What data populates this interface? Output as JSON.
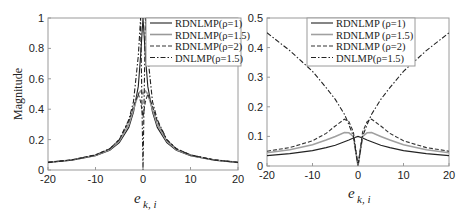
{
  "chart_data": [
    {
      "type": "line",
      "title": "",
      "xlabel": "e_{k,i}",
      "xlabel_main": "e",
      "xlabel_sub": "k, i",
      "ylabel": "Magnitude",
      "xlim": [
        -20,
        20
      ],
      "ylim": [
        0,
        1
      ],
      "xticks": [
        "-20",
        "-10",
        "0",
        "10",
        "20"
      ],
      "yticks": [
        "0",
        "0.2",
        "0.4",
        "0.6",
        "0.8",
        "1"
      ],
      "grid": false,
      "legend_position": "upper right",
      "legend": [
        "RDNLMP(ρ=1)",
        "RDNLMP(ρ=1.5)",
        "RDNLMP(ρ=2)",
        "DNLMP(ρ=1.5)"
      ],
      "x": [
        -20,
        -15,
        -10,
        -7,
        -5,
        -3,
        -2,
        -1,
        -0.5,
        0,
        0.5,
        1,
        2,
        3,
        5,
        7,
        10,
        15,
        20
      ],
      "series": [
        {
          "name": "RDNLMP(ρ=1)",
          "style": "solid",
          "color": "#222222",
          "values": [
            0.05,
            0.065,
            0.095,
            0.13,
            0.18,
            0.28,
            0.38,
            0.55,
            0.75,
            1.0,
            0.75,
            0.55,
            0.38,
            0.28,
            0.18,
            0.13,
            0.095,
            0.065,
            0.05
          ]
        },
        {
          "name": "RDNLMP(ρ=1.5)",
          "style": "solid",
          "color": "#999999",
          "values": [
            0.05,
            0.066,
            0.097,
            0.135,
            0.19,
            0.3,
            0.4,
            0.5,
            0.52,
            0.5,
            0.52,
            0.5,
            0.4,
            0.3,
            0.19,
            0.135,
            0.097,
            0.066,
            0.05
          ]
        },
        {
          "name": "RDNLMP(ρ=2)",
          "style": "dashed",
          "color": "#333333",
          "values": [
            0.05,
            0.067,
            0.1,
            0.14,
            0.2,
            0.32,
            0.42,
            0.5,
            0.45,
            0.35,
            0.45,
            0.5,
            0.42,
            0.32,
            0.2,
            0.14,
            0.1,
            0.067,
            0.05
          ]
        },
        {
          "name": "DNLMP(ρ=1.5)",
          "style": "dashdot",
          "color": "#222222",
          "values": [
            0.05,
            0.066,
            0.098,
            0.14,
            0.2,
            0.33,
            0.45,
            0.75,
            1.0,
            0.0,
            1.0,
            0.75,
            0.45,
            0.33,
            0.2,
            0.14,
            0.098,
            0.066,
            0.05
          ]
        }
      ]
    },
    {
      "type": "line",
      "title": "",
      "xlabel": "e_{k,i}",
      "xlabel_main": "e",
      "xlabel_sub": "k, i",
      "ylabel": "",
      "xlim": [
        -20,
        20
      ],
      "ylim": [
        0,
        0.5
      ],
      "xticks": [
        "-20",
        "-10",
        "0",
        "10",
        "20"
      ],
      "yticks": [
        "0",
        "0.1",
        "0.2",
        "0.3",
        "0.4",
        "0.5"
      ],
      "grid": false,
      "legend_position": "upper center",
      "legend": [
        "RDNLMP (ρ=1)",
        "RDNLMP (ρ=1.5)",
        "RDNLMP (ρ=2)",
        "DNLMP(ρ=1.5)"
      ],
      "x": [
        -20,
        -15,
        -10,
        -7,
        -5,
        -3,
        -2,
        -1,
        0,
        1,
        2,
        3,
        5,
        7,
        10,
        15,
        20
      ],
      "series": [
        {
          "name": "RDNLMP (ρ=1)",
          "style": "solid",
          "color": "#222222",
          "values": [
            0.035,
            0.042,
            0.052,
            0.062,
            0.07,
            0.082,
            0.088,
            0.095,
            0.1,
            0.095,
            0.088,
            0.082,
            0.07,
            0.062,
            0.052,
            0.042,
            0.035
          ]
        },
        {
          "name": "RDNLMP (ρ=1.5)",
          "style": "solid",
          "color": "#a0a0a0",
          "values": [
            0.045,
            0.055,
            0.072,
            0.088,
            0.1,
            0.113,
            0.112,
            0.1,
            0.0,
            0.1,
            0.112,
            0.113,
            0.1,
            0.088,
            0.072,
            0.055,
            0.045
          ]
        },
        {
          "name": "RDNLMP (ρ=2)",
          "style": "dashed",
          "color": "#333333",
          "values": [
            0.05,
            0.062,
            0.085,
            0.11,
            0.135,
            0.158,
            0.15,
            0.115,
            0.0,
            0.115,
            0.15,
            0.158,
            0.135,
            0.11,
            0.085,
            0.062,
            0.05
          ]
        },
        {
          "name": "DNLMP(ρ=1.5)",
          "style": "dashdot",
          "color": "#222222",
          "values": [
            0.45,
            0.39,
            0.32,
            0.265,
            0.225,
            0.175,
            0.14,
            0.1,
            0.0,
            0.1,
            0.14,
            0.175,
            0.225,
            0.265,
            0.32,
            0.39,
            0.45
          ]
        }
      ]
    }
  ]
}
